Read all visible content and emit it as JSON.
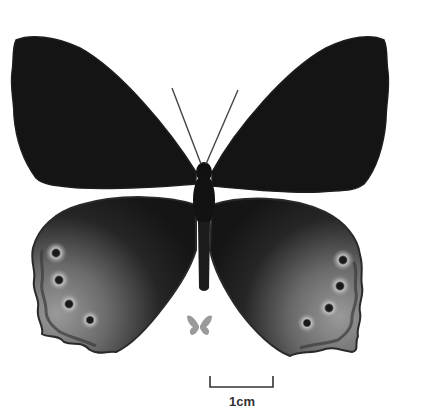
{
  "image": {
    "subject": "butterfly specimen, dorsal view",
    "background": "#ffffff",
    "wing_color": "#141414",
    "hindwing_band_color": "#8a8a8a",
    "eyespot_count_per_hindwing": 4
  },
  "size_reference": {
    "icon": "small-butterfly-silhouette",
    "color": "#9a9a9a"
  },
  "scale_bar": {
    "label": "1cm",
    "color": "#333333"
  }
}
